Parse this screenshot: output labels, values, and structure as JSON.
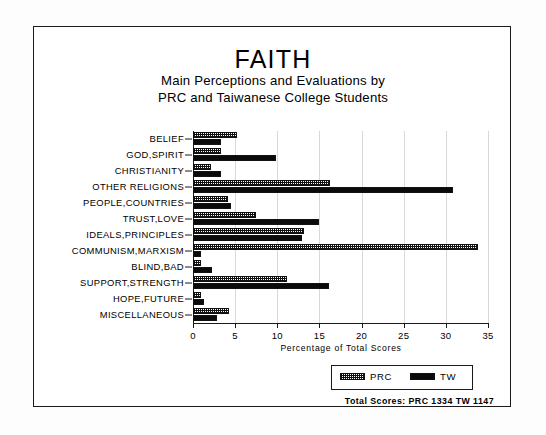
{
  "figure": {
    "title": "FAITH",
    "subtitle_line1": "Main Perceptions and Evaluations by",
    "subtitle_line2": "PRC and Taiwanese College Students",
    "totals_note": "Total Scores:  PRC 1334   TW 1147"
  },
  "legend": {
    "prc_label": "PRC",
    "tw_label": "TW"
  },
  "chart_data": {
    "type": "bar",
    "orientation": "horizontal",
    "title": "FAITH",
    "subtitle": "Main Perceptions and Evaluations by PRC and Taiwanese College Students",
    "xlabel": "Percentage of Total Scores",
    "ylabel": "",
    "xlim": [
      0,
      35
    ],
    "xticks": [
      0,
      5,
      10,
      15,
      20,
      25,
      30,
      35
    ],
    "xtick_labels": [
      "0",
      "5",
      "10",
      "15",
      "20",
      "25",
      "30",
      "35"
    ],
    "grid": true,
    "legend_position": "bottom-right",
    "categories": [
      "BELIEF",
      "GOD,SPIRIT",
      "CHRISTIANITY",
      "OTHER RELIGIONS",
      "PEOPLE,COUNTRIES",
      "TRUST,LOVE",
      "IDEALS,PRINCIPLES",
      "COMMUNISM,MARXISM",
      "BLIND,BAD",
      "SUPPORT,STRENGTH",
      "HOPE,FUTURE",
      "MISCELLANEOUS"
    ],
    "series": [
      {
        "name": "PRC",
        "values": [
          5.2,
          3.3,
          2.1,
          16.2,
          4.2,
          7.5,
          13.2,
          33.8,
          0.9,
          11.2,
          0.9,
          4.3
        ]
      },
      {
        "name": "TW",
        "values": [
          3.3,
          9.9,
          3.3,
          30.8,
          4.5,
          15.0,
          12.9,
          0.9,
          2.3,
          16.1,
          1.3,
          2.9
        ]
      }
    ],
    "annotations": [
      "Total Scores:  PRC 1334   TW 1147"
    ]
  }
}
